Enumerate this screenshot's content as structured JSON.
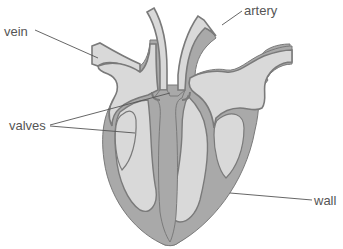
{
  "diagram": {
    "labels": {
      "vein": "vein",
      "artery": "artery",
      "valves": "valves",
      "wall": "wall"
    },
    "colors": {
      "background": "#ffffff",
      "wall_fill": "#a9a9a9",
      "chamber_fill": "#d9d9d9",
      "outline": "#7a7a7a",
      "label_text": "#555555"
    }
  }
}
